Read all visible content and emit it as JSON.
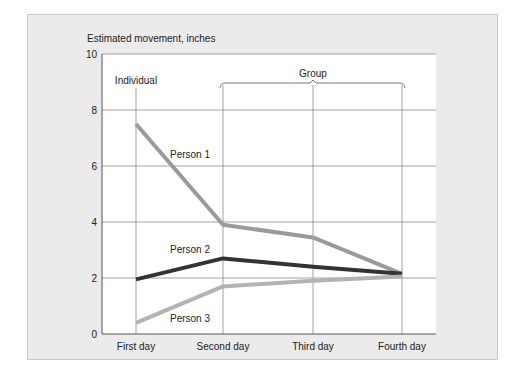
{
  "chart_data": {
    "type": "line",
    "title": "",
    "ylabel": "Estimated movement, inches",
    "xlabel": "",
    "categories": [
      "First day",
      "Second day",
      "Third day",
      "Fourth day"
    ],
    "ylim": [
      0,
      10
    ],
    "yticks": [
      "0",
      "2",
      "4",
      "6",
      "8",
      "10"
    ],
    "grid": true,
    "annotations": {
      "individual": "Individual",
      "group": "Group"
    },
    "series": [
      {
        "name": "Person 1",
        "color": "#9a9a9a",
        "values": [
          7.5,
          3.9,
          3.45,
          2.15
        ]
      },
      {
        "name": "Person 2",
        "color": "#333333",
        "values": [
          1.95,
          2.7,
          2.4,
          2.15
        ]
      },
      {
        "name": "Person 3",
        "color": "#b3b3b3",
        "values": [
          0.4,
          1.7,
          1.9,
          2.05
        ]
      }
    ]
  }
}
